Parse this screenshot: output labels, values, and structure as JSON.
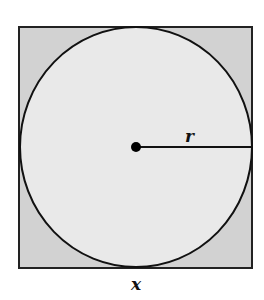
{
  "diagram": {
    "square": {
      "x": 19,
      "y": 27,
      "width": 233,
      "height": 241,
      "fill": "#d2d2d2",
      "stroke": "#222222"
    },
    "circle": {
      "cx": 136,
      "cy": 147,
      "r": 116,
      "fill": "#e9e9e9",
      "stroke": "#111111"
    },
    "center_point": {
      "cx": 136,
      "cy": 147,
      "r": 5,
      "fill": "#000000"
    },
    "radius_line": {
      "x1": 136,
      "y1": 147,
      "x2": 251,
      "y2": 147
    },
    "labels": {
      "radius": "r",
      "side": "x"
    }
  }
}
